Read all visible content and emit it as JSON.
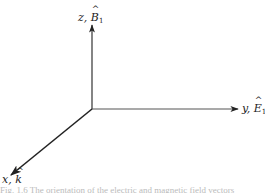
{
  "figure": {
    "type": "3d-coordinate-axes",
    "origin": {
      "x": 92,
      "y": 109
    },
    "axes": [
      {
        "id": "z",
        "label_var": "z",
        "label_vec": "B",
        "label_sub": "1",
        "direction": "up"
      },
      {
        "id": "y",
        "label_var": "y",
        "label_vec": "E",
        "label_sub": "1",
        "direction": "right"
      },
      {
        "id": "x",
        "label_var": "x",
        "label_vec": "k",
        "label_sub": "",
        "direction": "down-left"
      }
    ],
    "caption": "Fig. 1.6 The orientation of the electric and magnetic field vectors"
  }
}
